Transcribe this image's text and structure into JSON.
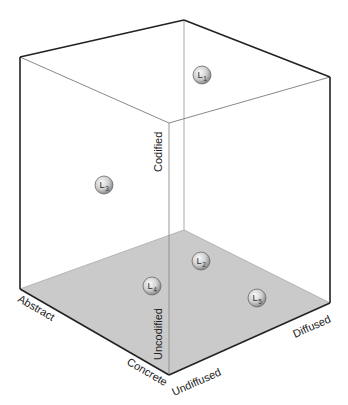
{
  "diagram": {
    "type": "3d-cube",
    "colors": {
      "floor": "#cacaca",
      "edge_dark": "#222222",
      "edge_light": "#9a9a9a",
      "edge_inner": "#bdbdbd",
      "node_fill_light": "#f2f2f2",
      "node_fill_dark": "#8a8a8a"
    },
    "axes": {
      "codified": "Codified",
      "uncodified": "Uncodified",
      "abstract": "Abstract",
      "concrete": "Concrete",
      "undiffused": "Undiffused",
      "diffused": "Diffused"
    },
    "nodes": [
      {
        "id": "L1",
        "letter": "L",
        "sub": "1",
        "x": 202,
        "y": 75
      },
      {
        "id": "L2",
        "letter": "L",
        "sub": "2",
        "x": 201,
        "y": 261
      },
      {
        "id": "L3",
        "letter": "L",
        "sub": "3",
        "x": 104,
        "y": 185
      },
      {
        "id": "L4",
        "letter": "L",
        "sub": "4",
        "x": 152,
        "y": 286
      },
      {
        "id": "L5",
        "letter": "L",
        "sub": "5",
        "x": 257,
        "y": 298
      }
    ]
  }
}
